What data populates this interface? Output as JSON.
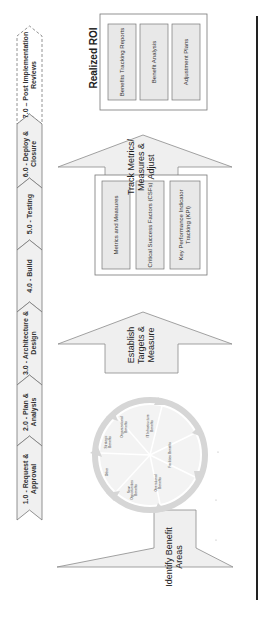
{
  "phases": [
    {
      "id": "7.0",
      "label": "7.0 – Post Implementation Reviews",
      "style": "dashed"
    },
    {
      "id": "6.0",
      "label": "6.0 - Deploy & Closure",
      "style": "solid"
    },
    {
      "id": "5.0",
      "label": "5.0 - Testing",
      "style": "solid"
    },
    {
      "id": "4.0",
      "label": "4.0 - Build",
      "style": "solid"
    },
    {
      "id": "3.0",
      "label": "3.0 - Architecture & Design",
      "style": "solid"
    },
    {
      "id": "2.0",
      "label": "2.0 - Plan & Analysis",
      "style": "solid"
    },
    {
      "id": "1.0",
      "label": "1.0 - Request & Approval",
      "style": "solid"
    }
  ],
  "arrows": {
    "identify": "Identify Benefit Areas",
    "establish": "Establish Targets & Measure",
    "track": "Track Metrics/ Measures & Adjust"
  },
  "benefit_wheel": {
    "segments": [
      "Organizational Benefits",
      "IT Infrastructure Benefits",
      "Facilities Benefits",
      "Operational Benefits",
      "New Opportunities Benefits",
      "Other",
      "Strategic Benefits"
    ]
  },
  "metrics_box": {
    "items": [
      "Metrics and Measures",
      "Critical Success Factors (CSFs)",
      "Key Performance Indicator Tracking (KPI)"
    ]
  },
  "roi": {
    "title": "Realized ROI",
    "items": [
      "Benefits Tracking Reports",
      "Benefit Analysis",
      "Adjustment Plans"
    ]
  },
  "colors": {
    "shape_fill": "#efefef",
    "shape_stroke": "#888888",
    "wheel_arrow": "#d4d4d4",
    "divider": "#222222"
  }
}
